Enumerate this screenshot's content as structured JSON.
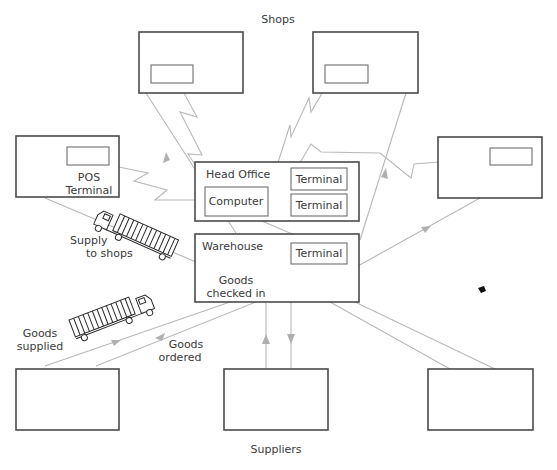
{
  "diagram": {
    "title_top": "Shops",
    "title_bottom": "Suppliers",
    "shop_pos": {
      "label_line1": "POS",
      "label_line2": "Terminal"
    },
    "head_office": {
      "title": "Head Office",
      "computer": "Computer",
      "terminal_1": "Terminal",
      "terminal_2": "Terminal"
    },
    "warehouse": {
      "title": "Warehouse",
      "terminal": "Terminal",
      "goods_line1": "Goods",
      "goods_line2": "checked in"
    },
    "flow_labels": {
      "supply_line1": "Supply",
      "supply_line2": "to shops",
      "supplied_line1": "Goods",
      "supplied_line2": "supplied",
      "ordered_line1": "Goods",
      "ordered_line2": "ordered"
    },
    "icons": [
      "truck-icon",
      "truck-icon"
    ],
    "colors": {
      "box_stroke": "#4a4a4a",
      "link_stroke": "#b8b8b8",
      "text": "#3a3a3a"
    }
  }
}
